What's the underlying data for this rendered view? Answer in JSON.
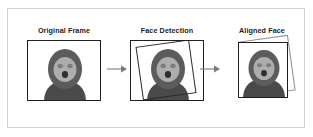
{
  "figure": {
    "background_color": "#ffffff",
    "border_color": "#d2d2d2",
    "panel_border_color": "#1f1f1f",
    "arrow_color": "#7a7a7a",
    "text_color": "#1c1c1c"
  },
  "stages": [
    {
      "id": "original-frame",
      "label": "Original Frame",
      "has_detection_box": false,
      "has_ghost_box": false
    },
    {
      "id": "face-detection",
      "label": "Face Detection",
      "has_detection_box": true,
      "has_ghost_box": false,
      "detection_box_rotation_deg": -8
    },
    {
      "id": "aligned-face",
      "label": "Aligned Face",
      "has_detection_box": false,
      "has_ghost_box": true,
      "ghost_box_rotation_deg": -8
    }
  ],
  "arrows": [
    {
      "id": "arrow-original-to-detection",
      "direction": "right"
    },
    {
      "id": "arrow-detection-to-aligned",
      "direction": "right"
    }
  ],
  "avatar": {
    "description": "cartoon person with dark hood and light face",
    "hood_color": "#5c5c5c",
    "face_color": "#adadad",
    "body_color": "#4a4a4a",
    "eye_color": "#7d7d7d",
    "mouth_color": "#2e2e2e",
    "background_color": "#ffffff"
  }
}
